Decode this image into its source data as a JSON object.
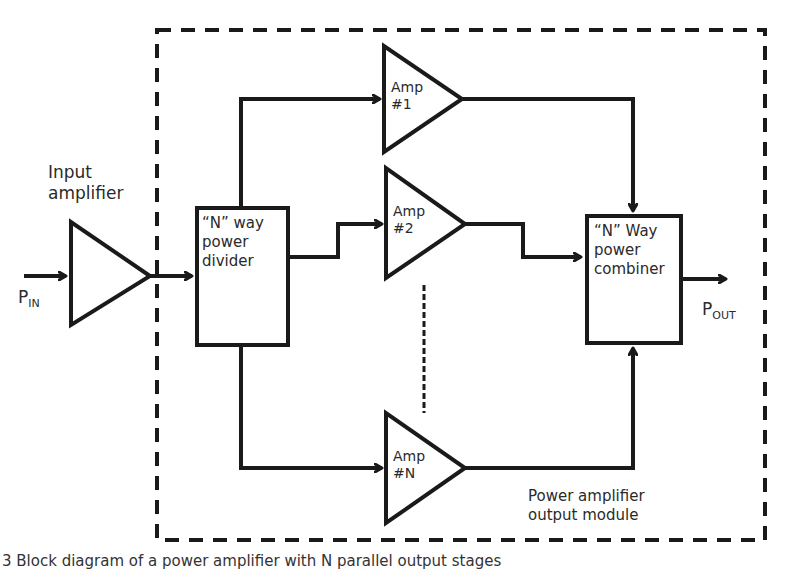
{
  "diagram": {
    "type": "block-diagram",
    "input_label": {
      "main": "P",
      "sub": "IN"
    },
    "output_label": {
      "main": "P",
      "sub": "OUT"
    },
    "input_amplifier": {
      "line1": "Input",
      "line2": "amplifier"
    },
    "divider": {
      "line1": "“N” way",
      "line2": "power",
      "line3": "divider"
    },
    "combiner": {
      "line1": "“N” Way",
      "line2": "power",
      "line3": "combiner"
    },
    "amps": [
      {
        "line1": "Amp",
        "line2": "#1"
      },
      {
        "line1": "Amp",
        "line2": "#2"
      },
      {
        "line1": "Amp",
        "line2": "#N"
      }
    ],
    "module_label": {
      "line1": "Power amplifier",
      "line2": "output module"
    },
    "caption": "3  Block diagram of a power amplifier with N parallel output stages",
    "colors": {
      "stroke": "#1a1a1a",
      "text": "#2a2a2a",
      "background": "#ffffff"
    }
  }
}
